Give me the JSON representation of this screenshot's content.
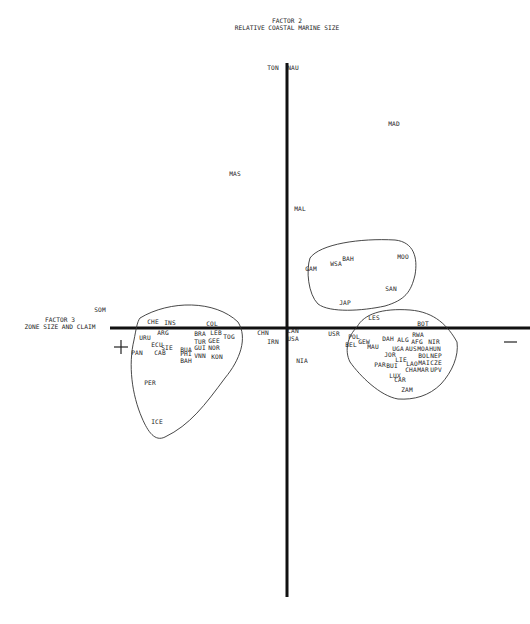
{
  "chart_data": {
    "type": "scatter",
    "title": "",
    "y_axis": {
      "label_line1": "FACTOR 2",
      "label_line2": "RELATIVE COASTAL MARINE SIZE"
    },
    "x_axis": {
      "label_line1": "FACTOR 3",
      "label_line2": "ZONE SIZE AND CLAIM"
    },
    "x_negative_sign": "+",
    "x_positive_sign": "—",
    "grid": false,
    "legend": null,
    "points": [
      {
        "label": "TON",
        "x": 273,
        "y": 70
      },
      {
        "label": "NAU",
        "x": 293,
        "y": 70
      },
      {
        "label": "MAD",
        "x": 394,
        "y": 126
      },
      {
        "label": "MAS",
        "x": 235,
        "y": 176
      },
      {
        "label": "MAL",
        "x": 300,
        "y": 211
      },
      {
        "label": "BAH",
        "x": 348,
        "y": 261
      },
      {
        "label": "WSA",
        "x": 336,
        "y": 266
      },
      {
        "label": "MOO",
        "x": 403,
        "y": 259
      },
      {
        "label": "GAM",
        "x": 311,
        "y": 271
      },
      {
        "label": "SAN",
        "x": 391,
        "y": 291
      },
      {
        "label": "JAP",
        "x": 345,
        "y": 305
      },
      {
        "label": "SOM",
        "x": 100,
        "y": 312
      },
      {
        "label": "LES",
        "x": 374,
        "y": 320
      },
      {
        "label": "CHE",
        "x": 153,
        "y": 324
      },
      {
        "label": "INS",
        "x": 170,
        "y": 325
      },
      {
        "label": "COL",
        "x": 212,
        "y": 326
      },
      {
        "label": "BOT",
        "x": 423,
        "y": 326
      },
      {
        "label": "URU",
        "x": 145,
        "y": 340
      },
      {
        "label": "ARG",
        "x": 163,
        "y": 335
      },
      {
        "label": "BRA",
        "x": 200,
        "y": 336
      },
      {
        "label": "LEB",
        "x": 216,
        "y": 335
      },
      {
        "label": "TOG",
        "x": 229,
        "y": 339
      },
      {
        "label": "CHN",
        "x": 263,
        "y": 335
      },
      {
        "label": "CAN",
        "x": 293,
        "y": 333
      },
      {
        "label": "USA",
        "x": 293,
        "y": 341
      },
      {
        "label": "IRN",
        "x": 273,
        "y": 344
      },
      {
        "label": "USR",
        "x": 334,
        "y": 336
      },
      {
        "label": "POL",
        "x": 354,
        "y": 339
      },
      {
        "label": "BEL",
        "x": 351,
        "y": 347
      },
      {
        "label": "GEW",
        "x": 364,
        "y": 344
      },
      {
        "label": "MAU",
        "x": 373,
        "y": 349
      },
      {
        "label": "DAH",
        "x": 388,
        "y": 341
      },
      {
        "label": "ALG",
        "x": 403,
        "y": 342
      },
      {
        "label": "RWA",
        "x": 418,
        "y": 337
      },
      {
        "label": "AFG",
        "x": 417,
        "y": 344
      },
      {
        "label": "NIR",
        "x": 434,
        "y": 344
      },
      {
        "label": "ECU",
        "x": 157,
        "y": 347
      },
      {
        "label": "SIE",
        "x": 167,
        "y": 350
      },
      {
        "label": "BUA",
        "x": 186,
        "y": 352
      },
      {
        "label": "TUR",
        "x": 200,
        "y": 344
      },
      {
        "label": "GEE",
        "x": 214,
        "y": 343
      },
      {
        "label": "GUI",
        "x": 200,
        "y": 350
      },
      {
        "label": "NOR",
        "x": 214,
        "y": 350
      },
      {
        "label": "UGA",
        "x": 398,
        "y": 351
      },
      {
        "label": "AUS",
        "x": 411,
        "y": 351
      },
      {
        "label": "MOA",
        "x": 423,
        "y": 351
      },
      {
        "label": "HUN",
        "x": 435,
        "y": 351
      },
      {
        "label": "PAN",
        "x": 137,
        "y": 355
      },
      {
        "label": "CAB",
        "x": 160,
        "y": 355
      },
      {
        "label": "PHI",
        "x": 186,
        "y": 356
      },
      {
        "label": "BAH",
        "x": 186,
        "y": 363
      },
      {
        "label": "VNN",
        "x": 200,
        "y": 358
      },
      {
        "label": "KON",
        "x": 217,
        "y": 359
      },
      {
        "label": "JOR",
        "x": 390,
        "y": 357
      },
      {
        "label": "BOL",
        "x": 424,
        "y": 358
      },
      {
        "label": "NEP",
        "x": 436,
        "y": 358
      },
      {
        "label": "LIE",
        "x": 401,
        "y": 362
      },
      {
        "label": "LAO",
        "x": 412,
        "y": 366
      },
      {
        "label": "MAI",
        "x": 424,
        "y": 365
      },
      {
        "label": "CZE",
        "x": 436,
        "y": 365
      },
      {
        "label": "NIA",
        "x": 302,
        "y": 363
      },
      {
        "label": "PAR",
        "x": 380,
        "y": 367
      },
      {
        "label": "BUI",
        "x": 392,
        "y": 368
      },
      {
        "label": "CHA",
        "x": 411,
        "y": 372
      },
      {
        "label": "MAR",
        "x": 423,
        "y": 372
      },
      {
        "label": "UPV",
        "x": 436,
        "y": 372
      },
      {
        "label": "LUX",
        "x": 395,
        "y": 378
      },
      {
        "label": "CAR",
        "x": 400,
        "y": 382
      },
      {
        "label": "ZAM",
        "x": 407,
        "y": 392
      },
      {
        "label": "PER",
        "x": 150,
        "y": 385
      },
      {
        "label": "ICE",
        "x": 157,
        "y": 424
      }
    ],
    "clusters": [
      {
        "name": "left-cluster",
        "members": [
          "CHE",
          "INS",
          "COL",
          "URU",
          "ARG",
          "BRA",
          "LEB",
          "TOG",
          "ECU",
          "SIE",
          "BUA",
          "TUR",
          "GEE",
          "GUI",
          "NOR",
          "PAN",
          "CAB",
          "PHI",
          "BAH",
          "VNN",
          "KON",
          "PER",
          "ICE"
        ]
      },
      {
        "name": "upper-right-cluster",
        "members": [
          "GAM",
          "WSA",
          "BAH",
          "MOO",
          "SAN",
          "JAP"
        ]
      },
      {
        "name": "lower-right-cluster",
        "members": [
          "LES",
          "BOT",
          "POL",
          "BEL",
          "GEW",
          "MAU",
          "DAH",
          "ALG",
          "RWA",
          "AFG",
          "NIR",
          "UGA",
          "AUS",
          "MOA",
          "HUN",
          "JOR",
          "BOL",
          "NEP",
          "LIE",
          "LAO",
          "MAI",
          "CZE",
          "PAR",
          "BUI",
          "CHA",
          "MAR",
          "UPV",
          "LUX",
          "CAR",
          "ZAM"
        ]
      }
    ]
  }
}
